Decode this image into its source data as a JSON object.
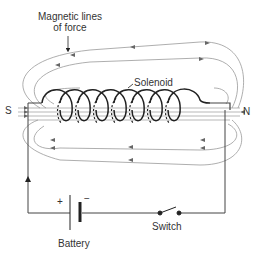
{
  "diagram": {
    "labels": {
      "magnetic_lines_1": "Magnetic lines",
      "magnetic_lines_2": "of force",
      "solenoid": "Solenoid",
      "south": "S",
      "north": "N",
      "plus": "+",
      "minus": "−",
      "battery": "Battery",
      "switch": "Switch"
    },
    "colors": {
      "line": "#555555",
      "field_line": "#888888",
      "coil": "#222222",
      "text": "#333333"
    },
    "components": [
      {
        "name": "Solenoid",
        "turns": 7
      },
      {
        "name": "Battery",
        "terminals": [
          "+",
          "−"
        ]
      },
      {
        "name": "Switch",
        "state": "open"
      }
    ],
    "poles": [
      "S",
      "N"
    ]
  }
}
